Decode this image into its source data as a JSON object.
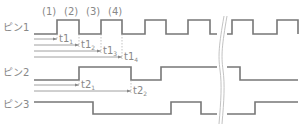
{
  "pins": [
    {
      "label": "ピン1"
    },
    {
      "label": "ピン2"
    },
    {
      "label": "ピン3"
    }
  ],
  "edges": [
    "(1)",
    "(2)",
    "(3)",
    "(4)"
  ],
  "pin1_times": [
    {
      "base": "t1",
      "sub": "1"
    },
    {
      "base": "t1",
      "sub": "2"
    },
    {
      "base": "t1",
      "sub": "3"
    },
    {
      "base": "t1",
      "sub": "4"
    }
  ],
  "pin2_times": [
    {
      "base": "t2",
      "sub": "1"
    },
    {
      "base": "t2",
      "sub": "2"
    }
  ],
  "colors": {
    "waveform": "#777777",
    "text": "#888888"
  }
}
